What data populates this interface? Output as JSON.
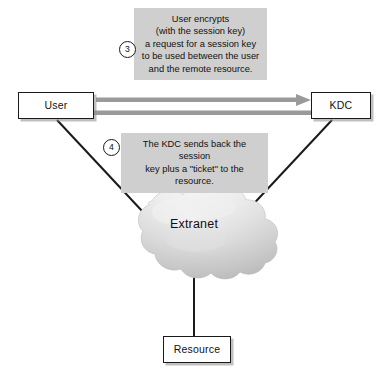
{
  "diagram": {
    "background_color": "#ffffff",
    "nodes": {
      "user": {
        "label": "User"
      },
      "kdc": {
        "label": "KDC"
      },
      "resource": {
        "label": "Resource"
      },
      "cloud": {
        "label": "Extranet"
      }
    },
    "steps": [
      {
        "number": "3",
        "text": "User encrypts (with the session key) a request for a session key to be used between the user and the remote resource.",
        "lines": [
          "User encrypts",
          "(with the session key)",
          "a request for a session key",
          "to be used between the user",
          "and the remote resource."
        ]
      },
      {
        "number": "4",
        "text": "The KDC sends back the session key plus a \"ticket\" to the resource.",
        "lines": [
          "The KDC sends back the session",
          "key plus a \"ticket\" to the resource."
        ]
      }
    ],
    "connectors": [
      {
        "name": "user-to-kdc-arrow",
        "from": "User",
        "to": "KDC",
        "direction": "right",
        "style": "gray-arrow"
      },
      {
        "name": "kdc-to-user-arrow",
        "from": "KDC",
        "to": "User",
        "direction": "left",
        "style": "gray-arrow"
      },
      {
        "name": "user-to-extranet-line",
        "from": "User",
        "to": "Extranet",
        "style": "black-line"
      },
      {
        "name": "kdc-to-extranet-line",
        "from": "KDC",
        "to": "Extranet",
        "style": "black-line"
      },
      {
        "name": "extranet-to-resource-line",
        "from": "Extranet",
        "to": "Resource",
        "style": "black-line"
      }
    ],
    "colors": {
      "callout_background": "#cfcfcf",
      "arrow_gray": "#9a9a9a",
      "line_black": "#1a1a1a",
      "cloud_gray": "#d8d8d8",
      "box_border": "#1a1a1a",
      "box_fill": "#ffffff",
      "text": "#111111"
    }
  }
}
